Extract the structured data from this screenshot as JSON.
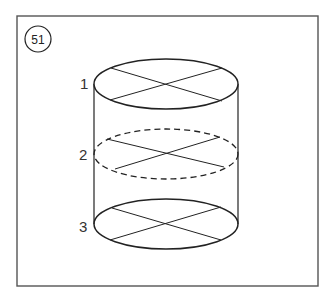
{
  "figure": {
    "number": "51",
    "labels": [
      "1",
      "2",
      "3"
    ]
  },
  "colors": {
    "line": "#222222",
    "frame": "#555555",
    "background": "#ffffff"
  },
  "cylinder": {
    "cx": 166,
    "rx": 72,
    "ry": 25,
    "levels": [
      {
        "label": "1",
        "cy": 84,
        "style": "solid"
      },
      {
        "label": "2",
        "cy": 154,
        "style": "dashed"
      },
      {
        "label": "3",
        "cy": 224,
        "style": "solid"
      }
    ]
  }
}
